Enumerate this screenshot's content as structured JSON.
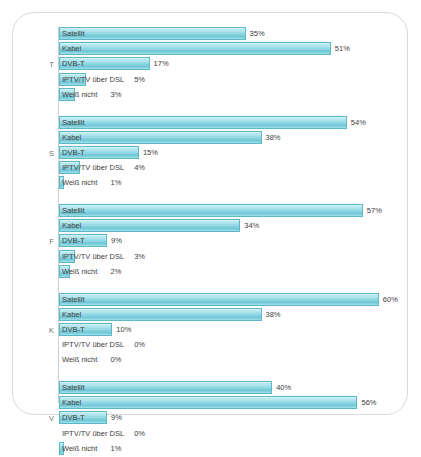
{
  "chart_data": {
    "type": "bar",
    "title": "",
    "subtitle": "",
    "xlabel": "",
    "ylabel": "",
    "xlim": [
      0,
      62
    ],
    "grid": false,
    "legend": "none",
    "orientation": "horizontal",
    "value_suffix": "%",
    "categories": [
      "Satellit",
      "Kabel",
      "DVB-T",
      "IPTV/TV über DSL",
      "Weiß nicht"
    ],
    "groups": [
      {
        "label": "T",
        "values": [
          35,
          51,
          17,
          5,
          3
        ],
        "value_labels": [
          "35%",
          "51%",
          "17%",
          "5%",
          "3%"
        ]
      },
      {
        "label": "S",
        "values": [
          54,
          38,
          15,
          4,
          1
        ],
        "value_labels": [
          "54%",
          "38%",
          "15%",
          "4%",
          "1%"
        ]
      },
      {
        "label": "F",
        "values": [
          57,
          34,
          9,
          3,
          2
        ],
        "value_labels": [
          "57%",
          "34%",
          "9%",
          "3%",
          "2%"
        ]
      },
      {
        "label": "K",
        "values": [
          60,
          38,
          10,
          0,
          0
        ],
        "value_labels": [
          "60%",
          "38%",
          "10%",
          "0%",
          "0%"
        ]
      },
      {
        "label": "V",
        "values": [
          40,
          56,
          9,
          0,
          1
        ],
        "value_labels": [
          "40%",
          "56%",
          "9%",
          "0%",
          "1%"
        ]
      }
    ],
    "colors": {
      "bar_fill": "#9fdde6",
      "bar_border": "#5bb8c6",
      "text": "#3d3d3d",
      "axis": "#cfcfcf",
      "panel_border": "#d9d9d9",
      "background": "#ffffff"
    }
  }
}
